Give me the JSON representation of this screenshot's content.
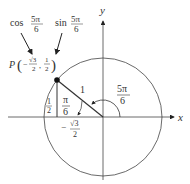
{
  "diagram": {
    "type": "unit-circle",
    "angle_label": {
      "numerator": "5π",
      "denominator": "6"
    },
    "reference_angle_label": {
      "numerator": "π",
      "denominator": "6"
    },
    "hypotenuse_label": "1",
    "axes": {
      "x_label": "x",
      "y_label": "y"
    },
    "point": {
      "name": "P",
      "x_sign": "−",
      "x_num": "√3",
      "x_den": "2",
      "y_num": "1",
      "y_den": "2"
    },
    "opposite_side_label": {
      "numerator": "1",
      "denominator": "2"
    },
    "adjacent_side_label": {
      "sign": "−",
      "numerator": "√3",
      "denominator": "2"
    },
    "callouts": {
      "cos": {
        "fn": "cos",
        "numerator": "5π",
        "denominator": "6"
      },
      "sin": {
        "fn": "sin",
        "numerator": "5π",
        "denominator": "6"
      }
    },
    "colors": {
      "stroke": "#333333",
      "background": "#ffffff"
    }
  }
}
